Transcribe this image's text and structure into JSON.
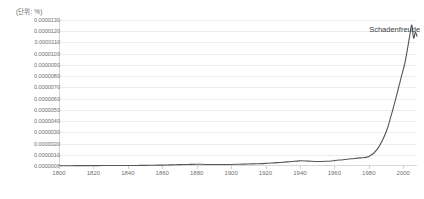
{
  "chart_data": {
    "type": "line",
    "title": "",
    "subtitle": "",
    "unit_label": "(단위: %)",
    "xlabel": "",
    "ylabel": "",
    "xlim": [
      1800,
      2008
    ],
    "ylim": [
      0.0,
      1.3e-05
    ],
    "grid": true,
    "legend_position": "none",
    "line_color": "#555555",
    "background_color": "#ffffff",
    "gridline_color": "#ececec",
    "axis_color": "#d5d5d5",
    "tick_label_color": "#6f6f6f",
    "annotations": [
      {
        "text": "Schadenfreude",
        "x": 1995,
        "y": 1.22e-05
      }
    ],
    "xticks": [
      1800,
      1820,
      1840,
      1860,
      1880,
      1900,
      1920,
      1940,
      1960,
      1980,
      2000
    ],
    "ytick_labels": [
      "0.0000130",
      "0.0000120",
      "0.0000110",
      "0.0000100",
      "0.0000090",
      "0.0000080",
      "0.0000070",
      "0.0000060",
      "0.0000050",
      "0.0000040",
      "0.0000030",
      "0.0000020",
      "0.0000010",
      "0.0000000"
    ],
    "yticks": [
      1.3e-05,
      1.2e-05,
      1.1e-05,
      1e-05,
      9e-06,
      8e-06,
      7e-06,
      6e-06,
      5e-06,
      4e-06,
      3e-06,
      2e-06,
      1e-06,
      0.0
    ],
    "series": [
      {
        "name": "Schadenfreude",
        "x": [
          1800,
          1805,
          1810,
          1815,
          1820,
          1825,
          1830,
          1835,
          1840,
          1845,
          1850,
          1855,
          1860,
          1865,
          1870,
          1875,
          1880,
          1885,
          1890,
          1895,
          1900,
          1905,
          1910,
          1915,
          1920,
          1925,
          1930,
          1935,
          1940,
          1945,
          1950,
          1955,
          1960,
          1965,
          1970,
          1975,
          1980,
          1985,
          1990,
          1993,
          1996,
          1999,
          2001,
          2003,
          2004,
          2005,
          2006,
          2007,
          2008
        ],
        "values": [
          2e-08,
          2e-08,
          3e-08,
          3e-08,
          3e-08,
          4e-08,
          4e-08,
          4e-08,
          5e-08,
          5e-08,
          6e-08,
          7e-08,
          8e-08,
          1e-07,
          1.2e-07,
          1.4e-07,
          1.6e-07,
          1.4e-07,
          1.3e-07,
          1.3e-07,
          1.4e-07,
          1.6e-07,
          1.8e-07,
          2e-07,
          2.3e-07,
          2.8e-07,
          3.3e-07,
          4e-07,
          4.6e-07,
          4.3e-07,
          4e-07,
          4.2e-07,
          4.8e-07,
          5.6e-07,
          6.4e-07,
          7.2e-07,
          8.5e-07,
          1.5e-06,
          3e-06,
          4.5e-06,
          6.2e-06,
          8e-06,
          9.2e-06,
          1.09e-05,
          1.18e-05,
          1.255e-05,
          1.14e-05,
          1.19e-05,
          1.155e-05
        ]
      }
    ]
  }
}
